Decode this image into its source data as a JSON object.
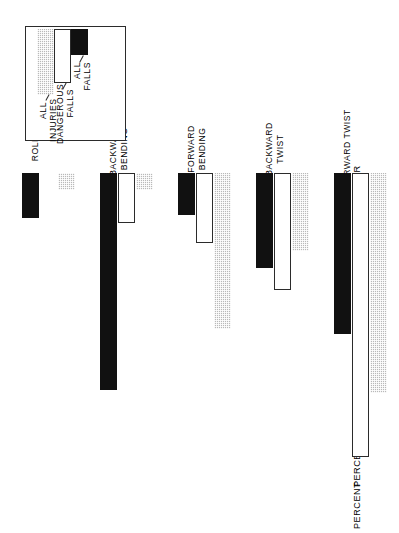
{
  "chart_data": {
    "type": "bar",
    "orientation": "horizontal-printed-sideways",
    "title": "PERCENT OF FALL TYPES — VIDEO ANALYSIS AND INJURED SKIER",
    "xlabel": "",
    "ylabel": "PERCENT",
    "axis_title": "PERCENT",
    "categories": [
      "PURE TWIST",
      "FORWARD TWIST",
      "BACKWARD TWIST",
      "FORWARD\nBENDING",
      "BACKWARD\nBENDING",
      "ROLL"
    ],
    "series": [
      {
        "name": "ALL FALLS",
        "style": "black",
        "values": [
          5.0,
          29.0,
          17.0,
          7.5,
          39.0,
          8.0
        ]
      },
      {
        "name": "DANGEROUS FALLS",
        "style": "outline",
        "values": [
          6.0,
          51.0,
          21.0,
          12.5,
          9.0,
          0.0
        ]
      },
      {
        "name": "ALL INJURIES",
        "style": "stipple",
        "values": [
          12.5,
          39.5,
          14.0,
          28.0,
          3.0,
          3.0
        ]
      }
    ],
    "ticks": [
      0,
      10,
      20,
      30,
      40,
      50,
      60
    ],
    "ylim": [
      0,
      60
    ],
    "grid": false,
    "legend_position": "top-right-inset",
    "colors": {
      "all_falls": "#111111",
      "dangerous_falls": "#ffffff",
      "all_injuries": "#b9b9b9",
      "axis": "#3a3a3a"
    }
  },
  "legend": {
    "entries": [
      {
        "label": "ALL INJURIES"
      },
      {
        "label": "DANGEROUS\nFALLS"
      },
      {
        "label": "ALL\nFALLS"
      }
    ]
  }
}
